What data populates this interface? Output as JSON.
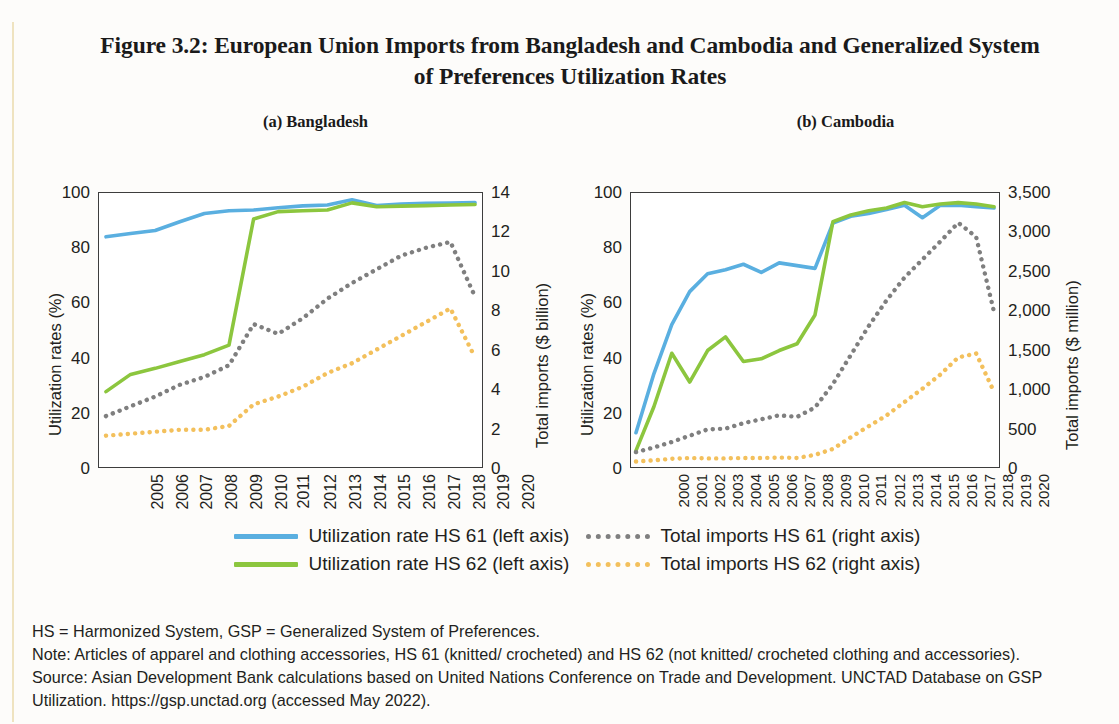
{
  "figure": {
    "title_line1": "Figure 3.2: European Union Imports from Bangladesh and Cambodia and Generalized System",
    "title_line2": "of Preferences Utilization Rates"
  },
  "colors": {
    "hs61_rate": "#5aafe0",
    "hs62_rate": "#8cc63e",
    "hs61_imports": "#7f7f7f",
    "hs62_imports": "#f3c05c",
    "axis": "#3d3d3d",
    "page_background": "#fdfcfa",
    "edge_rule": "#efe3c0"
  },
  "legend": {
    "items": [
      {
        "label": "Utilization rate HS 61 (left axis)",
        "color": "#5aafe0",
        "style": "solid",
        "name": "legend-hs61-rate"
      },
      {
        "label": "Total imports HS 61 (right axis)",
        "color": "#7f7f7f",
        "style": "dotted",
        "name": "legend-hs61-imports"
      },
      {
        "label": "Utilization rate HS 62 (left axis)",
        "color": "#8cc63e",
        "style": "solid",
        "name": "legend-hs62-rate"
      },
      {
        "label": "Total imports HS 62 (right axis)",
        "color": "#f3c05c",
        "style": "dotted",
        "name": "legend-hs62-imports"
      }
    ]
  },
  "notes": {
    "line1": "HS = Harmonized System, GSP = Generalized System of Preferences.",
    "line2": "Note: Articles of apparel and clothing accessories, HS 61 (knitted/ crocheted) and HS 62 (not knitted/ crocheted clothing and accessories).",
    "line3": "Source: Asian Development Bank calculations based on United Nations Conference on Trade and Development. UNCTAD Database on GSP",
    "line4": "Utilization.  https://gsp.unctad.org (accessed May 2022)."
  },
  "chart_data": [
    {
      "type": "line",
      "title": "(a) Bangladesh",
      "xlabel": "",
      "ylabel": "Utilization rates (%)",
      "y2label": "Total imports ($ billion)",
      "grid": false,
      "legend_position": "bottom",
      "x": [
        "2005",
        "2006",
        "2007",
        "2008",
        "2009",
        "2010",
        "2011",
        "2012",
        "2013",
        "2014",
        "2015",
        "2016",
        "2017",
        "2018",
        "2019",
        "2020"
      ],
      "ylim": [
        0,
        100
      ],
      "yticks": [
        0,
        20,
        40,
        60,
        80,
        100
      ],
      "y2lim": [
        0,
        14
      ],
      "y2ticks": [
        0,
        2,
        4,
        6,
        8,
        10,
        12,
        14
      ],
      "series": [
        {
          "name": "Utilization rate HS 61 (left axis)",
          "axis": "left",
          "color": "#5aafe0",
          "style": "solid",
          "values": [
            84.0,
            85.2,
            86.3,
            89.5,
            92.5,
            93.5,
            93.8,
            94.6,
            95.3,
            95.6,
            97.5,
            95.4,
            96.0,
            96.2,
            96.3,
            96.5
          ]
        },
        {
          "name": "Utilization rate HS 62 (left axis)",
          "axis": "left",
          "color": "#8cc63e",
          "style": "solid",
          "values": [
            27.5,
            33.8,
            36.0,
            38.5,
            41.0,
            44.5,
            90.5,
            93.2,
            93.5,
            93.8,
            96.4,
            95.0,
            95.2,
            95.4,
            95.6,
            95.8
          ]
        },
        {
          "name": "Total imports HS 61 (right axis)",
          "axis": "right",
          "color": "#7f7f7f",
          "style": "dotted",
          "values": [
            2.6,
            3.1,
            3.6,
            4.2,
            4.6,
            5.2,
            7.3,
            6.8,
            7.6,
            8.6,
            9.4,
            10.1,
            10.8,
            11.2,
            11.5,
            8.7
          ]
        },
        {
          "name": "Total imports HS 62 (right axis)",
          "axis": "right",
          "color": "#f3c05c",
          "style": "dotted",
          "values": [
            1.6,
            1.7,
            1.8,
            1.9,
            1.9,
            2.1,
            3.2,
            3.6,
            4.1,
            4.8,
            5.3,
            6.0,
            6.7,
            7.4,
            8.1,
            5.6
          ]
        }
      ]
    },
    {
      "type": "line",
      "title": "(b) Cambodia",
      "xlabel": "",
      "ylabel": "Utilization rates (%)",
      "y2label": "Total imports ($ million)",
      "grid": false,
      "legend_position": "bottom",
      "x": [
        "2000",
        "2001",
        "2002",
        "2003",
        "2004",
        "2005",
        "2006",
        "2007",
        "2008",
        "2009",
        "2010",
        "2011",
        "2012",
        "2013",
        "2014",
        "2015",
        "2016",
        "2017",
        "2018",
        "2019",
        "2020"
      ],
      "ylim": [
        0,
        100
      ],
      "yticks": [
        0,
        20,
        40,
        60,
        80,
        100
      ],
      "y2lim": [
        0,
        3500
      ],
      "y2ticks": [
        0,
        500,
        1000,
        1500,
        2000,
        2500,
        3000,
        3500
      ],
      "y2ticklabels": [
        "0",
        "500",
        "1,000",
        "1,500",
        "2,000",
        "2,500",
        "3,000",
        "3,500"
      ],
      "series": [
        {
          "name": "Utilization rate HS 61 (left axis)",
          "axis": "left",
          "color": "#5aafe0",
          "style": "solid",
          "values": [
            12.5,
            34.0,
            52.0,
            64.0,
            70.5,
            72.0,
            74.0,
            71.0,
            74.5,
            73.5,
            72.5,
            89.0,
            91.5,
            92.5,
            94.0,
            95.5,
            91.0,
            95.5,
            95.5,
            95.0,
            94.5
          ]
        },
        {
          "name": "Utilization rate HS 62 (left axis)",
          "axis": "left",
          "color": "#8cc63e",
          "style": "solid",
          "values": [
            6.0,
            22.0,
            41.5,
            31.0,
            42.5,
            47.5,
            38.5,
            39.5,
            42.5,
            45.0,
            55.5,
            89.5,
            92.0,
            93.5,
            94.5,
            96.5,
            95.0,
            96.0,
            96.5,
            96.0,
            95.0
          ]
        },
        {
          "name": "Total imports HS 61 (right axis)",
          "axis": "right",
          "color": "#7f7f7f",
          "style": "dotted",
          "values": [
            190,
            250,
            320,
            400,
            480,
            490,
            560,
            610,
            660,
            640,
            760,
            1060,
            1430,
            1800,
            2130,
            2420,
            2650,
            2880,
            3120,
            2940,
            1980
          ]
        },
        {
          "name": "Total imports HS 62 (right axis)",
          "axis": "right",
          "color": "#f3c05c",
          "style": "dotted",
          "values": [
            70,
            85,
            105,
            115,
            110,
            110,
            115,
            115,
            120,
            115,
            155,
            230,
            380,
            520,
            660,
            830,
            1000,
            1180,
            1400,
            1450,
            960
          ]
        }
      ]
    }
  ]
}
